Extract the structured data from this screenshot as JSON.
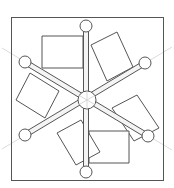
{
  "figure": {
    "caption_fragment": "",
    "colors": {
      "stroke": "#555555",
      "guide_line": "#d9d9d9",
      "fill": "#ffffff",
      "spoke_fill": "#f4f4f4"
    },
    "frame": {
      "x": 11,
      "y": 17,
      "width": 152,
      "height": 163
    },
    "hub": {
      "cx": 87,
      "cy": 100,
      "r": 9
    },
    "spokes": [
      {
        "name": "vertical",
        "x1": 86,
        "y1": 26,
        "x2": 86,
        "y2": 172
      },
      {
        "name": "diagonal-down",
        "x1": 25,
        "y1": 62,
        "x2": 148,
        "y2": 136
      },
      {
        "name": "diagonal-up",
        "x1": 25,
        "y1": 135,
        "x2": 145,
        "y2": 63
      }
    ],
    "end_circles": [
      {
        "name": "top",
        "cx": 86,
        "cy": 26,
        "r": 6
      },
      {
        "name": "bottom",
        "cx": 86,
        "cy": 172,
        "r": 6
      },
      {
        "name": "upper-left",
        "cx": 25,
        "cy": 62,
        "r": 6
      },
      {
        "name": "lower-left",
        "cx": 25,
        "cy": 135,
        "r": 6
      },
      {
        "name": "upper-right",
        "cx": 145,
        "cy": 63,
        "r": 6
      },
      {
        "name": "lower-right",
        "cx": 148,
        "cy": 136,
        "r": 6
      }
    ],
    "rectangles": [
      {
        "name": "top-left",
        "points": "42,36 83,36 83,68 42,68"
      },
      {
        "name": "upper-right",
        "points": "91,45 117,32 133,67 107,81"
      },
      {
        "name": "right",
        "points": "112,108 137,95 159,128 134,141"
      },
      {
        "name": "bottom",
        "points": "89,131 129,131 129,163 89,163"
      },
      {
        "name": "lower-left",
        "points": "57,133 81,120 100,152 76,165"
      },
      {
        "name": "left",
        "points": "16,100 30,73 59,91 45,118"
      }
    ]
  }
}
